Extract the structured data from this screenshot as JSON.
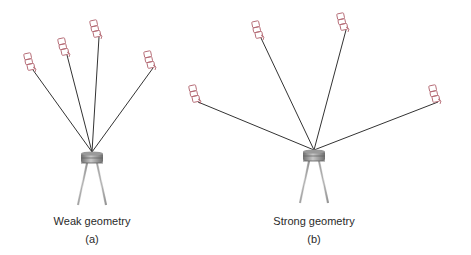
{
  "figure": {
    "panels": [
      {
        "id": "a",
        "caption": "Weak geometry",
        "sublabel": "(a)",
        "receiver": {
          "x": 92,
          "y": 152
        },
        "satellites": [
          {
            "x": 30,
            "y": 65
          },
          {
            "x": 64,
            "y": 50
          },
          {
            "x": 96,
            "y": 32
          },
          {
            "x": 150,
            "y": 63
          }
        ]
      },
      {
        "id": "b",
        "caption": "Strong geometry",
        "sublabel": "(b)",
        "receiver": {
          "x": 314,
          "y": 150
        },
        "satellites": [
          {
            "x": 195,
            "y": 97
          },
          {
            "x": 258,
            "y": 33
          },
          {
            "x": 343,
            "y": 25
          },
          {
            "x": 435,
            "y": 97
          }
        ]
      }
    ],
    "colors": {
      "satellite_outline": "#b46a74",
      "ray": "#333333",
      "receiver_body": "#8a8a8a",
      "receiver_legs": "#9a9a9a",
      "text": "#2a2a2a"
    }
  }
}
